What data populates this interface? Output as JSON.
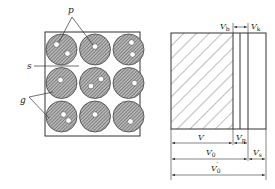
{
  "left_figure": {
    "labels": {
      "p": "p",
      "s": "s",
      "g": "g"
    },
    "grid": {
      "rows": 3,
      "cols": 3
    },
    "particles": [
      {
        "row": 0,
        "col": 0,
        "pores": [
          [
            -5,
            -5
          ],
          [
            6,
            4
          ]
        ]
      },
      {
        "row": 0,
        "col": 1,
        "pores": [
          [
            0,
            -3
          ]
        ]
      },
      {
        "row": 0,
        "col": 2,
        "pores": [
          [
            3,
            -7
          ],
          [
            4,
            5
          ]
        ]
      },
      {
        "row": 1,
        "col": 0,
        "pores": [
          [
            -1,
            -3
          ]
        ]
      },
      {
        "row": 1,
        "col": 1,
        "pores": [
          [
            6,
            -4
          ],
          [
            -4,
            3
          ]
        ]
      },
      {
        "row": 1,
        "col": 2,
        "pores": [
          [
            6,
            0
          ]
        ]
      },
      {
        "row": 2,
        "col": 0,
        "pores": [
          [
            2,
            -2
          ],
          [
            7,
            4
          ]
        ]
      },
      {
        "row": 2,
        "col": 1,
        "pores": [
          [
            0,
            -2
          ]
        ]
      },
      {
        "row": 2,
        "col": 2,
        "pores": [
          [
            2,
            5
          ]
        ]
      }
    ]
  },
  "right_figure": {
    "top_labels": {
      "vb": {
        "main": "V",
        "sub": "b"
      },
      "vk": {
        "main": "V",
        "sub": "k"
      }
    },
    "dimension_labels": {
      "v": {
        "main": "V",
        "sub": ""
      },
      "vp": {
        "main": "V",
        "sub": "p"
      },
      "v0": {
        "main": "V",
        "sub": "0"
      },
      "vs": {
        "main": "V",
        "sub": "s"
      },
      "v0prime": {
        "main": "V",
        "sub": "0",
        "prime": "′"
      }
    }
  }
}
